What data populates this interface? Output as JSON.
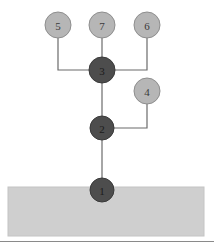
{
  "figure": {
    "title": "",
    "canvas": {
      "width": 214,
      "height": 247,
      "background": "#ffffff"
    },
    "ground": {
      "name": "ground",
      "x": 8,
      "y": 187,
      "width": 196,
      "height": 49,
      "fill": "#cfcfcf",
      "stroke": "#c4c4c4"
    },
    "bottom_rule": {
      "y": 241,
      "color": "#8a8a8a"
    },
    "colors": {
      "dark_node_fill": "#4d4d4d",
      "dark_node_stroke": "#3a3a3a",
      "light_node_fill": "#b6b6b6",
      "light_node_stroke": "#8e8e8e",
      "edge": "#6b6b6b",
      "ground_fill": "#cfcfcf",
      "label_dark": "#1c1c1c",
      "label_light": "#3a3a3a"
    },
    "nodes": [
      {
        "id": "node-1",
        "label": "1",
        "x": 102,
        "y": 190,
        "r": 12,
        "style": "dark"
      },
      {
        "id": "node-2",
        "label": "2",
        "x": 102,
        "y": 128,
        "r": 12,
        "style": "dark"
      },
      {
        "id": "node-3",
        "label": "3",
        "x": 102,
        "y": 70,
        "r": 13,
        "style": "dark"
      },
      {
        "id": "node-4",
        "label": "4",
        "x": 147,
        "y": 91,
        "r": 13,
        "style": "light"
      },
      {
        "id": "node-5",
        "label": "5",
        "x": 58,
        "y": 25,
        "r": 13,
        "style": "light"
      },
      {
        "id": "node-6",
        "label": "6",
        "x": 147,
        "y": 25,
        "r": 13,
        "style": "light"
      },
      {
        "id": "node-7",
        "label": "7",
        "x": 102,
        "y": 25,
        "r": 13,
        "style": "light"
      }
    ],
    "edges": [
      {
        "id": "edge-1-2",
        "from": "1",
        "to": "2",
        "kind": "straight",
        "points": "102,190 102,128"
      },
      {
        "id": "edge-2-3",
        "from": "2",
        "to": "3",
        "kind": "straight",
        "points": "102,128 102,70"
      },
      {
        "id": "edge-3-7",
        "from": "3",
        "to": "7",
        "kind": "straight",
        "points": "102,70 102,25"
      },
      {
        "id": "edge-3-5",
        "from": "3",
        "to": "5",
        "kind": "orthogonal",
        "points": "102,70 58,70 58,25"
      },
      {
        "id": "edge-3-6",
        "from": "3",
        "to": "6",
        "kind": "orthogonal",
        "points": "102,70 147,70 147,25"
      },
      {
        "id": "edge-2-4",
        "from": "2",
        "to": "4",
        "kind": "orthogonal",
        "points": "102,128 147,128 147,91"
      }
    ]
  }
}
